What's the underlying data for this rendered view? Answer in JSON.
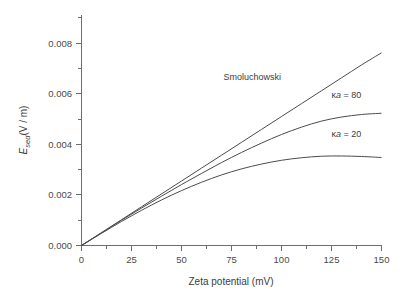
{
  "chart_data": {
    "type": "line",
    "title": "",
    "xlabel": "Zeta potential (mV)",
    "ylabel": "E_sed (V / m)",
    "ylabel_parts": {
      "symbol": "E",
      "subscript": "sed",
      "units": "(V / m)"
    },
    "xlim": [
      0,
      150
    ],
    "ylim": [
      0,
      0.009
    ],
    "xticks": [
      0,
      25,
      50,
      75,
      100,
      125,
      150
    ],
    "xtick_labels": [
      "0",
      "25",
      "50",
      "75",
      "100",
      "125",
      "150"
    ],
    "yticks": [
      0.0,
      0.002,
      0.004,
      0.006,
      0.008
    ],
    "ytick_labels": [
      "0.000",
      "0.002",
      "0.004",
      "0.006",
      "0.008"
    ],
    "x_minor_interval": 12.5,
    "y_minor_interval": 0.001,
    "grid": false,
    "legend_position": "inline-annotations",
    "x": [
      0,
      10,
      20,
      30,
      40,
      50,
      60,
      70,
      80,
      90,
      100,
      110,
      120,
      130,
      140,
      150
    ],
    "series": [
      {
        "name": "Smoluchowski",
        "label": "Smoluchowski",
        "color": "#4b4b4b",
        "values": [
          0.0,
          0.00051,
          0.00102,
          0.00153,
          0.00204,
          0.00255,
          0.00306,
          0.00357,
          0.00408,
          0.00459,
          0.0051,
          0.00561,
          0.00612,
          0.00663,
          0.00714,
          0.00762
        ],
        "annotation": {
          "text": "Smoluchowski",
          "x": 71,
          "y": 0.00655
        }
      },
      {
        "name": "kappa-a-80",
        "label": "κa = 80",
        "label_prefix": "κ",
        "label_italic": "a",
        "label_suffix": " = 80",
        "color": "#4b4b4b",
        "values": [
          0.0,
          0.0005,
          0.001,
          0.00148,
          0.00195,
          0.00241,
          0.00285,
          0.00328,
          0.00368,
          0.00405,
          0.00439,
          0.00468,
          0.00492,
          0.00508,
          0.00518,
          0.00523
        ],
        "annotation": {
          "text": "κa = 80",
          "x": 125,
          "y": 0.00585
        }
      },
      {
        "name": "kappa-a-20",
        "label": "κa = 20",
        "label_prefix": "κ",
        "label_italic": "a",
        "label_suffix": " = 20",
        "color": "#4b4b4b",
        "values": [
          0.0,
          0.00048,
          0.00095,
          0.00139,
          0.0018,
          0.00217,
          0.0025,
          0.00279,
          0.00303,
          0.00322,
          0.00337,
          0.00347,
          0.00353,
          0.00354,
          0.00352,
          0.00348
        ],
        "annotation": {
          "text": "κa = 20",
          "x": 125,
          "y": 0.0043
        }
      }
    ]
  },
  "axes": {
    "x_title": "Zeta potential (mV)",
    "y_symbol": "E",
    "y_subscript": "sed",
    "y_units": "(V / m)"
  },
  "ticks": {
    "x": [
      "0",
      "25",
      "50",
      "75",
      "100",
      "125",
      "150"
    ],
    "y": [
      "0.000",
      "0.002",
      "0.004",
      "0.006",
      "0.008"
    ]
  },
  "annotations": {
    "smoluchowski": "Smoluchowski",
    "kappa_80_prefix": "κ",
    "kappa_80_italic": "a",
    "kappa_80_suffix": " = 80",
    "kappa_20_prefix": "κ",
    "kappa_20_italic": "a",
    "kappa_20_suffix": " = 20"
  },
  "colors": {
    "axis": "#6d6d6d",
    "curve": "#4b4b4b",
    "text": "#3c3c3c",
    "background": "#ffffff"
  }
}
